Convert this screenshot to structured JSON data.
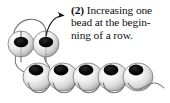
{
  "figure": {
    "kind": "beadwork-instruction-diagram",
    "background_color": "#ffffff",
    "caption": {
      "step_number": "(2)",
      "line1_rest": " Increasing one",
      "line2": "bead at the begin-",
      "line3": "ning of a row.",
      "full_text": "(2) Increasing one bead at the beginning of a row.",
      "text_color": "#111111"
    },
    "colors": {
      "thread": "#6b6b6b",
      "bead_outline": "#555555",
      "bead_highlight": "#ffffff",
      "bead_midtone": "#e2e2e2",
      "bead_shadow": "#9a9a9a",
      "bead_hole": "#000000",
      "arrow": "#1a1a1a"
    },
    "new_beads": {
      "label": "new beads added at start of row",
      "count": 2,
      "view": "side",
      "items": [
        {
          "name": "new-bead-1",
          "cx": 21,
          "cy": 44,
          "rx": 13,
          "ry": 13
        },
        {
          "name": "new-bead-2",
          "cx": 46,
          "cy": 44,
          "rx": 13,
          "ry": 13
        }
      ]
    },
    "row_beads": {
      "label": "existing row of beads",
      "count": 5,
      "view": "front",
      "items": [
        {
          "name": "row-bead-1",
          "cx": 38,
          "cy": 77,
          "rx": 15,
          "ry": 14
        },
        {
          "name": "row-bead-2",
          "cx": 63,
          "cy": 77,
          "rx": 15,
          "ry": 14
        },
        {
          "name": "row-bead-3",
          "cx": 88,
          "cy": 77,
          "rx": 15,
          "ry": 14
        },
        {
          "name": "row-bead-4",
          "cx": 113,
          "cy": 77,
          "rx": 15,
          "ry": 14
        },
        {
          "name": "row-bead-5",
          "cx": 138,
          "cy": 77,
          "rx": 15,
          "ry": 14
        }
      ]
    },
    "arrow": {
      "label": "direction-of-stitching arrow",
      "points_to": "right",
      "path": "M 47 36 C 50 22 58 16 66 16",
      "head_tip_x": 70,
      "head_tip_y": 16
    },
    "threads": [
      {
        "name": "top-arc",
        "path": "M 13 42 C 12 16 42 14 46 31"
      },
      {
        "name": "left-drop",
        "path": "M 17 55 C 14 64 20 70 28 72"
      },
      {
        "name": "right-drop",
        "path": "M 44 55 C 43 62 46 64 48 66 C 50 69 47 72 43 72"
      },
      {
        "name": "loop-1",
        "path": "M 30 86 C 36 96 46 96 51 86"
      },
      {
        "name": "loop-2",
        "path": "M 55 86 C 61 96 71 96 76 86"
      },
      {
        "name": "loop-3",
        "path": "M 80 86 C 86 96 96 96 101 86"
      },
      {
        "name": "loop-4",
        "path": "M 105 86 C 111 96 121 96 126 86"
      },
      {
        "name": "tail",
        "path": "M 130 86 C 138 94 146 86 152 84 C 157 82 161 84 163 86"
      }
    ]
  }
}
